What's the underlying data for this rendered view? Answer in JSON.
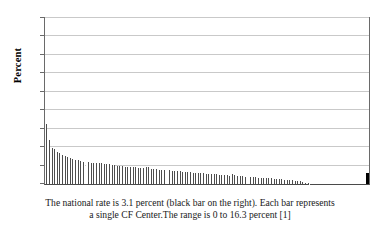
{
  "chart_data": {
    "type": "bar",
    "title": "",
    "subtitle": "",
    "xlabel": "",
    "ylabel": "Percent",
    "ylim": [
      0,
      45
    ],
    "yticks": [
      0,
      5,
      10,
      15,
      20,
      25,
      30,
      35,
      40,
      45
    ],
    "ytick_labels": [
      "0",
      "5",
      "10",
      "15",
      "20",
      "25",
      "30",
      "35",
      "40",
      "45"
    ],
    "xticks": [],
    "xtick_labels": [],
    "grid": "horizontal",
    "legend": "none",
    "series_note": "Each bar is a single CF Center, sorted descending. Final black bar is the national rate reference.",
    "series": [
      {
        "name": "CF Centers (sorted descending)",
        "color": "#4d4d4d",
        "values": [
          16.3,
          12.2,
          11.9,
          10.0,
          9.8,
          9.5,
          9.3,
          8.6,
          8.3,
          8.1,
          7.9,
          7.7,
          7.5,
          7.3,
          7.1,
          7.0,
          6.9,
          6.8,
          6.6,
          6.5,
          6.4,
          6.3,
          6.2,
          6.1,
          6.0,
          6.0,
          5.9,
          5.9,
          5.8,
          5.8,
          5.7,
          5.7,
          5.6,
          5.6,
          5.6,
          5.5,
          5.5,
          5.5,
          5.4,
          5.4,
          5.3,
          5.2,
          5.1,
          5.0,
          5.0,
          4.9,
          4.8,
          4.8,
          4.7,
          4.7,
          4.6,
          4.6,
          4.6,
          4.5,
          4.5,
          4.5,
          4.4,
          4.4,
          4.4,
          4.4,
          4.3,
          4.3,
          4.6,
          4.5,
          4.2,
          4.1,
          4.1,
          4.0,
          4.0,
          4.0,
          3.9,
          3.9,
          3.9,
          3.8,
          3.8,
          3.8,
          3.7,
          3.7,
          3.6,
          3.6,
          3.5,
          3.5,
          3.4,
          3.4,
          3.3,
          3.3,
          3.3,
          3.2,
          3.2,
          3.2,
          3.1,
          3.1,
          3.0,
          3.0,
          3.0,
          2.9,
          2.9,
          2.9,
          2.8,
          2.8,
          2.8,
          2.7,
          2.7,
          2.7,
          2.6,
          2.6,
          2.6,
          2.5,
          2.5,
          2.5,
          2.4,
          2.4,
          2.4,
          2.3,
          2.3,
          2.6,
          2.5,
          2.2,
          2.2,
          2.1,
          2.1,
          2.1,
          2.0,
          2.0,
          2.0,
          1.9,
          1.9,
          1.9,
          1.8,
          1.8,
          1.8,
          1.7,
          1.7,
          1.7,
          1.6,
          1.6,
          1.6,
          1.5,
          1.5,
          1.5,
          1.5,
          1.4,
          1.4,
          1.4,
          1.3,
          1.3,
          1.3,
          1.2,
          1.2,
          1.1,
          1.1,
          1.0,
          1.0,
          0.9,
          0.9,
          0.8,
          0.8,
          0.7,
          0.6,
          0.5,
          0.4,
          0.3,
          0.2,
          0.1,
          0.0,
          0.0,
          0.0,
          0.0,
          0.0,
          0.0,
          0.0,
          0.0,
          0.0,
          0.0,
          0.0,
          0.0,
          0.0,
          0.0,
          0.0,
          0.0,
          0.0,
          0.0,
          0.0,
          0.0,
          0.0,
          0.0,
          0.0,
          0.0,
          0.0,
          0.0,
          0.0,
          0.0,
          0.0,
          0.0,
          0.0,
          0.0,
          0.0,
          0.0,
          0.0,
          0.0
        ]
      },
      {
        "name": "National rate",
        "color": "#000000",
        "values": [
          3.1
        ]
      }
    ],
    "annotations": [
      "The national rate is 3.1 percent (black bar on the right).",
      "Each bar represents a single CF Center.",
      "The range is 0 to 16.3 percent [1]"
    ],
    "national_rate": 3.1,
    "range_min": 0,
    "range_max": 16.3
  },
  "axis": {
    "y_title": "Percent"
  },
  "caption": {
    "text": "The national rate is 3.1 percent (black bar on the right).  Each bar represents a single CF Center.The range is 0 to 16.3 percent [1]"
  },
  "colors": {
    "bar": "#4d4d4d",
    "national_bar": "#000000",
    "gridline": "#c9c9c9",
    "axis": "#6a6a6a",
    "background": "#ffffff",
    "text": "#000000"
  }
}
